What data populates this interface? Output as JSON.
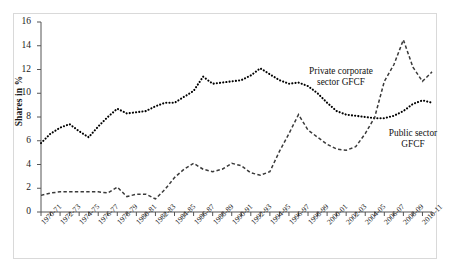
{
  "chart_data": {
    "type": "line",
    "title": "",
    "subtitle": "",
    "xlabel": "",
    "ylabel": "Shares in %",
    "ylim": [
      0,
      16
    ],
    "ytick_step": 2,
    "yticks": [
      "0",
      "2",
      "4",
      "6",
      "8",
      "10",
      "12",
      "14",
      "16"
    ],
    "grid": false,
    "legend_position": "inline-annotations",
    "x": [
      "1970-71",
      "1971-72",
      "1972-73",
      "1973-74",
      "1974-75",
      "1975-76",
      "1976-77",
      "1977-78",
      "1978-79",
      "1979-80",
      "1980-81",
      "1981-82",
      "1982-83",
      "1983-84",
      "1984-85",
      "1985-86",
      "1986-87",
      "1987-88",
      "1988-89",
      "1989-90",
      "1990-91",
      "1991-92",
      "1992-93",
      "1993-94",
      "1994-95",
      "1995-96",
      "1996-97",
      "1997-98",
      "1998-99",
      "1999-00",
      "2000-01",
      "2001-02",
      "2002-03",
      "2003-04",
      "2004-05",
      "2005-06",
      "2006-07",
      "2007-08",
      "2008-09",
      "2009-10",
      "2010-11",
      "2011-12"
    ],
    "xtick_labels": [
      "1970-71",
      "1972-73",
      "1974-75",
      "1976-77",
      "1978-79",
      "1980-81",
      "1982-83",
      "1984-85",
      "1986-87",
      "1988-89",
      "1990-91",
      "1992-93",
      "1994-95",
      "1996-97",
      "1998-99",
      "2000-01",
      "2002-03",
      "2004-05",
      "2006-07",
      "2008-09",
      "2010-11"
    ],
    "series": [
      {
        "name": "Public sector GFCF",
        "annotation": "Public sector\nGFCF",
        "marker": "dotted",
        "color": "#000000",
        "values": [
          5.8,
          6.6,
          7.1,
          7.4,
          6.8,
          6.3,
          7.2,
          8.0,
          8.7,
          8.3,
          8.4,
          8.5,
          8.9,
          9.2,
          9.2,
          9.7,
          10.2,
          11.4,
          10.8,
          10.9,
          11.0,
          11.1,
          11.5,
          12.1,
          11.6,
          11.1,
          10.8,
          10.9,
          10.6,
          10.0,
          9.2,
          8.5,
          8.2,
          8.1,
          8.0,
          7.9,
          7.9,
          8.1,
          8.5,
          9.1,
          9.4,
          9.2
        ]
      },
      {
        "name": "Private corporate sector GFCF",
        "annotation": "Private corporate\nsector GFCF",
        "marker": "dashed",
        "color": "#3a3a3a",
        "values": [
          1.4,
          1.6,
          1.7,
          1.7,
          1.7,
          1.7,
          1.7,
          1.6,
          2.1,
          1.3,
          1.5,
          1.5,
          1.1,
          1.9,
          2.9,
          3.6,
          4.1,
          3.6,
          3.4,
          3.6,
          4.1,
          3.9,
          3.3,
          3.1,
          3.4,
          5.1,
          6.6,
          8.2,
          6.9,
          6.3,
          5.7,
          5.3,
          5.2,
          5.5,
          6.6,
          8.0,
          11.0,
          12.4,
          14.5,
          12.2,
          11.0,
          11.8
        ]
      }
    ],
    "annotations": [
      {
        "text_line1": "Private corporate",
        "text_line2": "sector GFCF"
      },
      {
        "text_line1": "Public sector",
        "text_line2": "GFCF"
      }
    ]
  },
  "axes": {
    "y_axis_title": "Shares in %"
  }
}
